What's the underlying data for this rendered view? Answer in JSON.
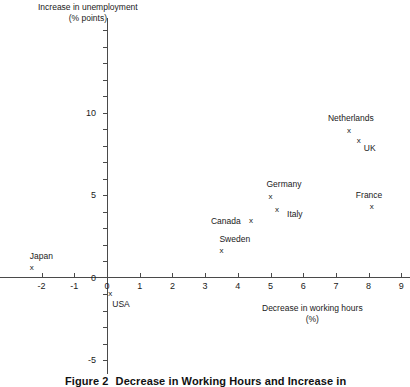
{
  "chart_data": {
    "type": "scatter",
    "title": "",
    "xlabel": "Decrease in working hours\n(%)",
    "ylabel": "Increase in unemployment\n(% points)",
    "xlabel_line1": "Decrease in working hours",
    "xlabel_line2": "(%)",
    "ylabel_line1": "Increase in unemployment",
    "ylabel_line2": "(% points)",
    "xlim": [
      -2.6,
      9.3
    ],
    "ylim": [
      -5.5,
      15.7
    ],
    "x_ticks": [
      -2,
      -1,
      0,
      1,
      2,
      3,
      4,
      5,
      6,
      7,
      8,
      9
    ],
    "x_tick_labels": [
      "-2",
      "-1",
      "0",
      "1",
      "2",
      "3",
      "4",
      "5",
      "6",
      "7",
      "8",
      "9"
    ],
    "y_ticks": [
      -5,
      -4,
      -3,
      -2,
      -1,
      0,
      1,
      2,
      3,
      4,
      5,
      6,
      7,
      8,
      9,
      10,
      11,
      12,
      13,
      14,
      15
    ],
    "y_tick_labels_shown": [
      {
        "value": 10,
        "label": "10"
      },
      {
        "value": 5,
        "label": "5"
      },
      {
        "value": 0,
        "label": "0"
      },
      {
        "value": -5,
        "label": "-5"
      }
    ],
    "grid": false,
    "legend": "none",
    "marker": "x",
    "points": [
      {
        "name": "Japan",
        "x": -2.3,
        "y": 0.6,
        "label_dx": -2,
        "label_dy": -12
      },
      {
        "name": "USA",
        "x": 0.1,
        "y": -1.0,
        "label_dx": 2,
        "label_dy": 10
      },
      {
        "name": "Sweden",
        "x": 3.5,
        "y": 1.6,
        "label_dx": -2,
        "label_dy": -12
      },
      {
        "name": "Canada",
        "x": 4.4,
        "y": 3.4,
        "label_dx": -40,
        "label_dy": 0
      },
      {
        "name": "Italy",
        "x": 5.2,
        "y": 4.1,
        "label_dx": 10,
        "label_dy": 4
      },
      {
        "name": "Germany",
        "x": 5.0,
        "y": 4.9,
        "label_dx": -4,
        "label_dy": -13
      },
      {
        "name": "France",
        "x": 8.1,
        "y": 4.3,
        "label_dx": -16,
        "label_dy": -12
      },
      {
        "name": "Netherlands",
        "x": 7.4,
        "y": 8.9,
        "label_dx": -21,
        "label_dy": -13
      },
      {
        "name": "UK",
        "x": 7.7,
        "y": 8.3,
        "label_dx": 5,
        "label_dy": 7
      }
    ]
  },
  "caption": {
    "figure_number": "Figure 2",
    "text": "Decrease in Working Hours and Increase in"
  },
  "colors": {
    "axis": "#4a4a4a",
    "text": "#1a1a1a",
    "background": "#ffffff"
  }
}
